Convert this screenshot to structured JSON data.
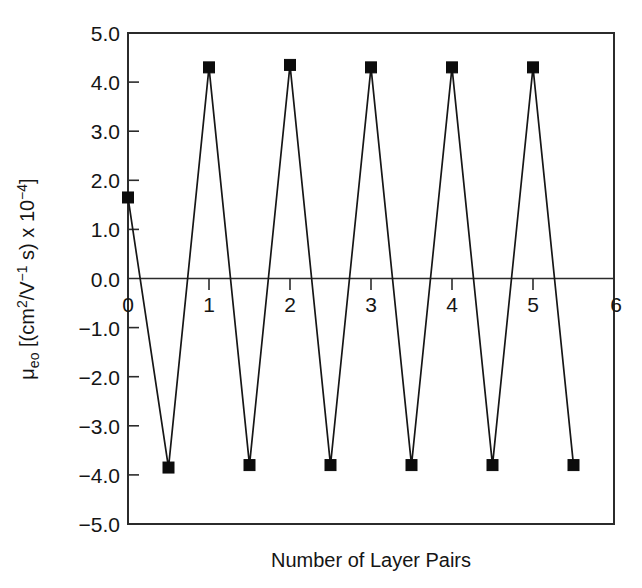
{
  "chart_data": {
    "type": "line",
    "title": "",
    "xlabel": "Number of Layer Pairs",
    "ylabel": "μeo [(cm2/V−1 s) x 10−4]",
    "ylabel_parts": {
      "mu": "μ",
      "sub": "eo",
      "open": " [(cm",
      "sup1": "2",
      "mid": "/V",
      "sup2": "−1",
      "mid2": " s) x 10",
      "sup3": "−4",
      "close": "]"
    },
    "xlim": [
      0,
      6
    ],
    "ylim": [
      -5.0,
      5.0
    ],
    "xticks": [
      0,
      1,
      2,
      3,
      4,
      5,
      6
    ],
    "xtick_labels": [
      "0",
      "1",
      "2",
      "3",
      "4",
      "5",
      "6"
    ],
    "yticks": [
      -5.0,
      -4.0,
      -3.0,
      -2.0,
      -1.0,
      0.0,
      1.0,
      2.0,
      3.0,
      4.0,
      5.0
    ],
    "ytick_labels": [
      "−5.0",
      "−4.0",
      "−3.0",
      "−2.0",
      "−1.0",
      "0.0",
      "1.0",
      "2.0",
      "3.0",
      "4.0",
      "5.0"
    ],
    "grid": false,
    "legend": false,
    "marker": "filled-square",
    "line_color": "#161616",
    "marker_color": "#0c0c0c",
    "series": [
      {
        "name": "electroosmotic mobility",
        "x": [
          0,
          0.5,
          1,
          1.5,
          2,
          2.5,
          3,
          3.5,
          4,
          4.5,
          5,
          5.5
        ],
        "y": [
          1.65,
          -3.85,
          4.3,
          -3.8,
          4.35,
          -3.8,
          4.3,
          -3.8,
          4.3,
          -3.8,
          4.3,
          -3.8
        ]
      }
    ]
  }
}
